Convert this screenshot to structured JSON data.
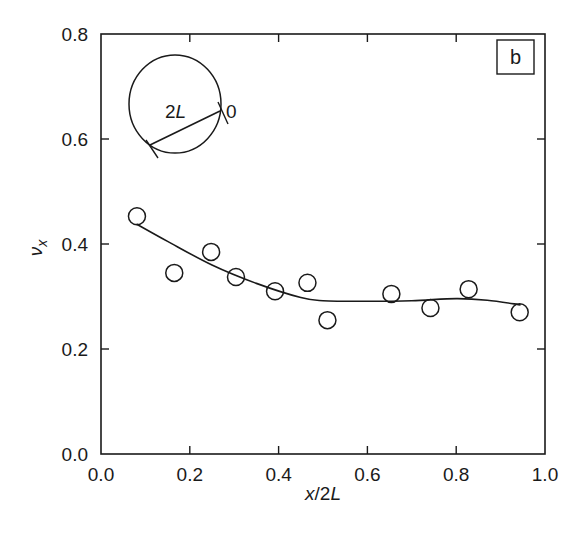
{
  "chart_data": {
    "type": "scatter",
    "title": "",
    "panel_label": "b",
    "xlabel": "x/2L",
    "ylabel": "ν_x",
    "xlim": [
      0.0,
      1.0
    ],
    "ylim": [
      0.0,
      0.8
    ],
    "grid": false,
    "legend": null,
    "x_ticks": [
      "0.0",
      "0.2",
      "0.4",
      "0.6",
      "0.8",
      "1.0"
    ],
    "y_ticks": [
      "0.0",
      "0.2",
      "0.4",
      "0.6",
      "0.8"
    ],
    "series": [
      {
        "name": "measured",
        "marker": "open-circle",
        "x": [
          0.081,
          0.165,
          0.248,
          0.304,
          0.392,
          0.465,
          0.51,
          0.654,
          0.742,
          0.828,
          0.943
        ],
        "y": [
          0.453,
          0.345,
          0.385,
          0.337,
          0.31,
          0.326,
          0.255,
          0.305,
          0.278,
          0.314,
          0.27
        ]
      },
      {
        "name": "fit",
        "style": "line",
        "x": [
          0.08,
          0.15,
          0.25,
          0.35,
          0.45,
          0.5,
          0.6,
          0.7,
          0.8,
          0.87,
          0.945
        ],
        "y": [
          0.438,
          0.405,
          0.36,
          0.325,
          0.298,
          0.292,
          0.291,
          0.292,
          0.296,
          0.293,
          0.284
        ]
      }
    ],
    "inset": {
      "shape": "circle",
      "chord_label": "2L",
      "origin_label": "0"
    }
  }
}
